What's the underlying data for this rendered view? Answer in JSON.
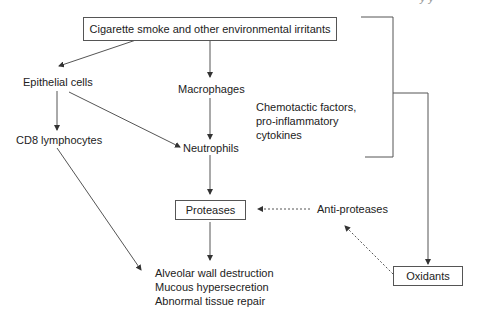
{
  "diagram": {
    "header_fragment": "y   y",
    "nodes": {
      "irritants": "Cigarette smoke and other environmental irritants",
      "epithelial": "Epithelial cells",
      "macrophages": "Macrophages",
      "cd8": "CD8 lymphocytes",
      "neutrophils": "Neutrophils",
      "mediators": "Chemotactic factors,\npro-inflammatory\ncytokines",
      "proteases": "Proteases",
      "anti_proteases": "Anti-proteases",
      "oxidants": "Oxidants",
      "outcomes": "Alveolar wall destruction\nMucous hypersecretion\nAbnormal tissue repair"
    },
    "edges": [
      {
        "from": "irritants",
        "to": "epithelial",
        "style": "solid"
      },
      {
        "from": "irritants",
        "to": "macrophages",
        "style": "solid"
      },
      {
        "from": "epithelial",
        "to": "cd8",
        "style": "solid"
      },
      {
        "from": "epithelial",
        "to": "neutrophils",
        "style": "solid"
      },
      {
        "from": "macrophages",
        "to": "neutrophils",
        "style": "solid"
      },
      {
        "from": "neutrophils",
        "to": "proteases",
        "style": "solid"
      },
      {
        "from": "cd8",
        "to": "outcomes",
        "style": "solid"
      },
      {
        "from": "proteases",
        "to": "outcomes",
        "style": "solid"
      },
      {
        "from": "anti_proteases",
        "to": "proteases",
        "style": "dashed"
      },
      {
        "from": "oxidants",
        "to": "anti_proteases",
        "style": "dashed"
      },
      {
        "from": "bracket",
        "to": "oxidants",
        "style": "solid"
      }
    ]
  }
}
